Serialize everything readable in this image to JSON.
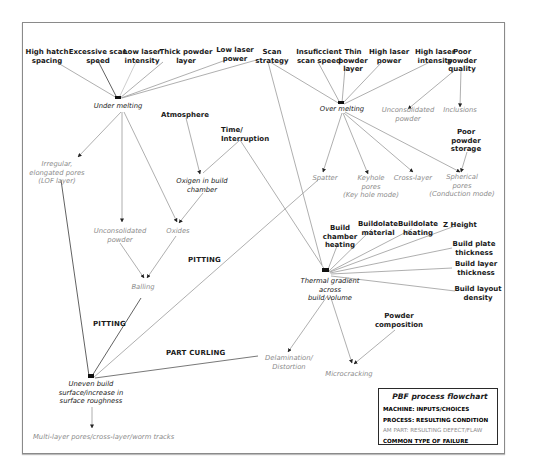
{
  "title": "PBF process flowchart",
  "colors": {
    "input_text": "#1a1a1a",
    "process_text": "#1a1a1a",
    "defect_text": "#8c8c8c",
    "edge": "#9a9a9a",
    "edge_dark": "#3a3a3a"
  },
  "nodes": {
    "high_hatch": "High hatch\nspacing",
    "excessive_scan": "Excessive scan\nspeed",
    "low_laser_int": "Low laser\nintensity",
    "thick_powder": "Thick powder\nlayer",
    "low_laser_power": "Low laser\npower",
    "scan_strategy": "Scan\nstrategy",
    "insufficient_scan": "Insuficcient\nscan speed",
    "thin_powder": "Thin\npowder\nlayer",
    "high_laser_power": "High laser\npower",
    "high_laser_int": "High laser\nintensity",
    "poor_powder_quality": "Poor\npowder\nquality",
    "under_melting": "Under melting",
    "over_melting": "Over melting",
    "unconsolidated_powder_right": "Unconsolidated\npowder",
    "inclusions": "Inclusions",
    "atmosphere": "Atmosphere",
    "time_interruption": "Time/\nInterruption",
    "poor_powder_storage": "Poor\npowder\nstorage",
    "irregular_pores": "Irregular,\nelongated pores\n(LOF layer)",
    "oxygen_chamber": "Oxigen in build\nchamber",
    "spatter": "Spatter",
    "keyhole_pores": "Keyhole\npores\n(Key hole mode)",
    "cross_layer": "Cross-layer",
    "spherical_pores": "Spherical\npores\n(Conduction mode)",
    "unconsolidated_powder_left": "Unconsolidated\npowder",
    "oxides": "Oxides",
    "balling": "Balling",
    "build_chamber_heating": "Build\nchamber\nheating",
    "buildplate_material": "Buildolate\nmaterial",
    "buildplate_heating": "Buildolate\nheating",
    "z_height": "Z Height",
    "build_plate_thickness": "Build plate\nthickness",
    "build_layer_thickness": "Build layer\nthickness",
    "build_layout_density": "Build layout\ndensity",
    "thermal_gradient": "Thermal gradient\nacross\nbuild volume",
    "powder_composition": "Powder\ncomposition",
    "delamination": "Delamination/\nDistortion",
    "microcracking": "Microcracking",
    "uneven_surface": "Uneven build\nsurface/increase in\nsurface roughness",
    "multilayer_pores": "Multi-layer pores/cross-layer/worm tracks"
  },
  "failures": {
    "pitting_1": "PITTING",
    "pitting_2": "PITTING",
    "part_curling": "PART CURLING"
  },
  "legend": {
    "title": "PBF process flowchart",
    "rows": [
      "MACHINE: INPUTS/CHOICES",
      "PROCESS: RESULTING CONDITION",
      "AM PART: RESULTING DEFECT/FLAW",
      "COMMON TYPE OF FAILURE"
    ]
  }
}
